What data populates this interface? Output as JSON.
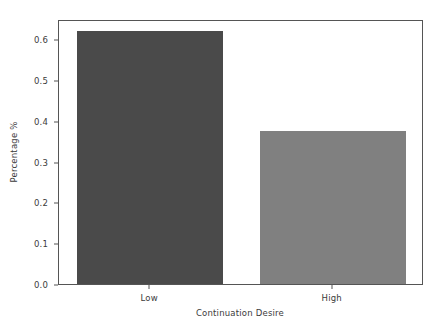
{
  "chart_data": {
    "type": "bar",
    "title": "",
    "xlabel": "Continuation Desire",
    "ylabel": "Percentage %",
    "categories": [
      "Low",
      "High"
    ],
    "values": [
      0.62,
      0.375
    ],
    "ylim": [
      0.0,
      0.65
    ],
    "xlim": [
      0,
      2
    ],
    "yticks": [
      0.0,
      0.1,
      0.2,
      0.3,
      0.4,
      0.5,
      0.6
    ],
    "ytick_labels": [
      "0.0",
      "0.1",
      "0.2",
      "0.3",
      "0.4",
      "0.5",
      "0.6"
    ],
    "xtick_labels": [
      "Low",
      "High"
    ],
    "grid": false,
    "legend": null,
    "bar_colors": [
      "#4a4a4a",
      "#808080"
    ],
    "background_color": "#ffffff",
    "axis_color": "#555555",
    "text_color": "#3b3b3b",
    "bars": [
      {
        "category": "Low",
        "value": 0.62,
        "color": "#4a4a4a"
      },
      {
        "category": "High",
        "value": 0.375,
        "color": "#808080"
      }
    ]
  }
}
